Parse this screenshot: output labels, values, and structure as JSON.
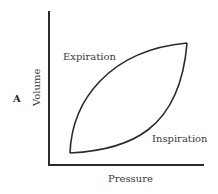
{
  "panel_label": "A",
  "axes": {
    "x_label": "Pressure",
    "y_label": "Volume"
  },
  "curves": {
    "upper_label": "Expiration",
    "lower_label": "Inspiration"
  },
  "colors": {
    "line": "#2b2b2b",
    "text": "#3a3a3a",
    "background": "#ffffff"
  }
}
